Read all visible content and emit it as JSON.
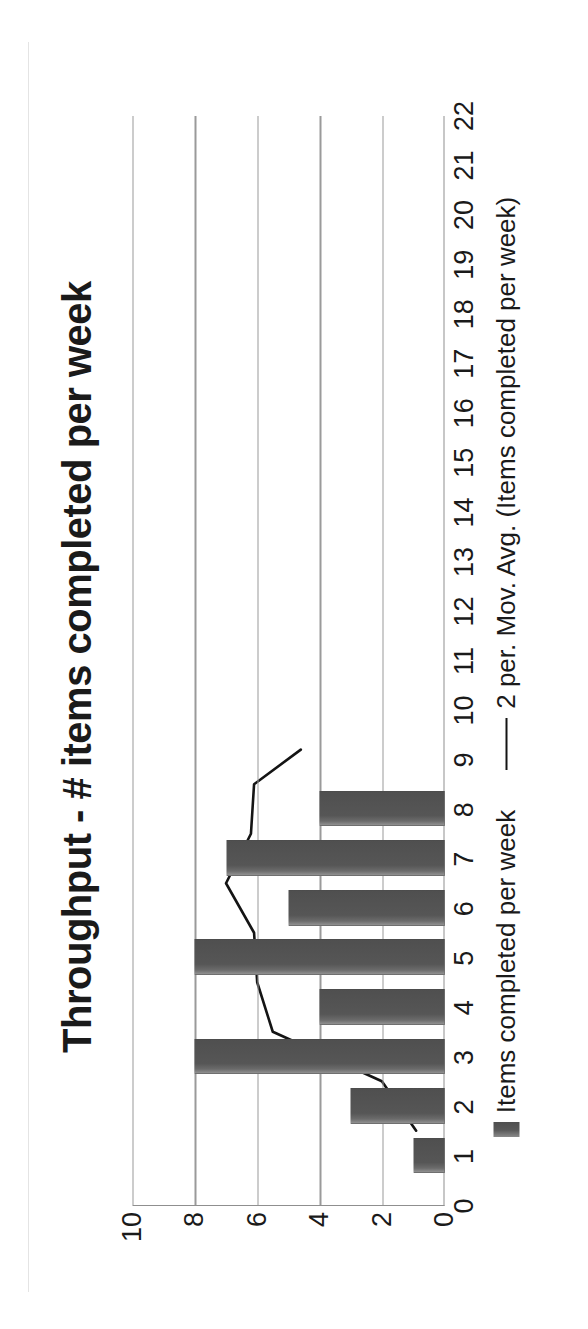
{
  "chart_data": {
    "type": "bar",
    "title": "Throughput - # items completed per week",
    "xlabel": "",
    "ylabel": "",
    "xlim": [
      0,
      22
    ],
    "ylim": [
      0,
      10
    ],
    "grid": true,
    "legend_position": "bottom",
    "x_tick_labels": [
      "0",
      "1",
      "2",
      "3",
      "4",
      "5",
      "6",
      "7",
      "8",
      "9",
      "10",
      "11",
      "12",
      "13",
      "14",
      "15",
      "16",
      "17",
      "18",
      "19",
      "20",
      "21",
      "22"
    ],
    "y_tick_labels": [
      "0",
      "2",
      "4",
      "6",
      "8",
      "10"
    ],
    "categories": [
      1,
      2,
      3,
      4,
      5,
      6,
      7,
      8
    ],
    "series": [
      {
        "name": "Items completed per week",
        "type": "bar",
        "color": "#565656",
        "values": [
          1,
          3,
          8,
          4,
          8,
          5,
          7,
          4
        ]
      },
      {
        "name": "2 per. Mov. Avg. (Items completed per week)",
        "type": "line",
        "color": "#141414",
        "x": [
          1.5,
          2.5,
          3.5,
          4.5,
          5.5,
          6.5,
          7.5,
          8.5
        ],
        "values": [
          null,
          2.0,
          5.5,
          6.0,
          6.0,
          6.5,
          6.0,
          5.5
        ]
      }
    ],
    "line_points_plotted": [
      {
        "x": 1.5,
        "y": 0.9
      },
      {
        "x": 2.5,
        "y": 2.0
      },
      {
        "x": 3.5,
        "y": 5.5
      },
      {
        "x": 4.5,
        "y": 6.0
      },
      {
        "x": 5.5,
        "y": 6.1
      },
      {
        "x": 6.5,
        "y": 7.0
      },
      {
        "x": 7.5,
        "y": 6.2
      },
      {
        "x": 8.5,
        "y": 6.1
      },
      {
        "x": 9.2,
        "y": 4.6
      }
    ]
  },
  "legend": {
    "items": [
      {
        "label": "Items completed per week",
        "marker": "bar-swatch"
      },
      {
        "label": "2 per. Mov. Avg. (Items completed per week)",
        "marker": "line-swatch"
      }
    ]
  }
}
